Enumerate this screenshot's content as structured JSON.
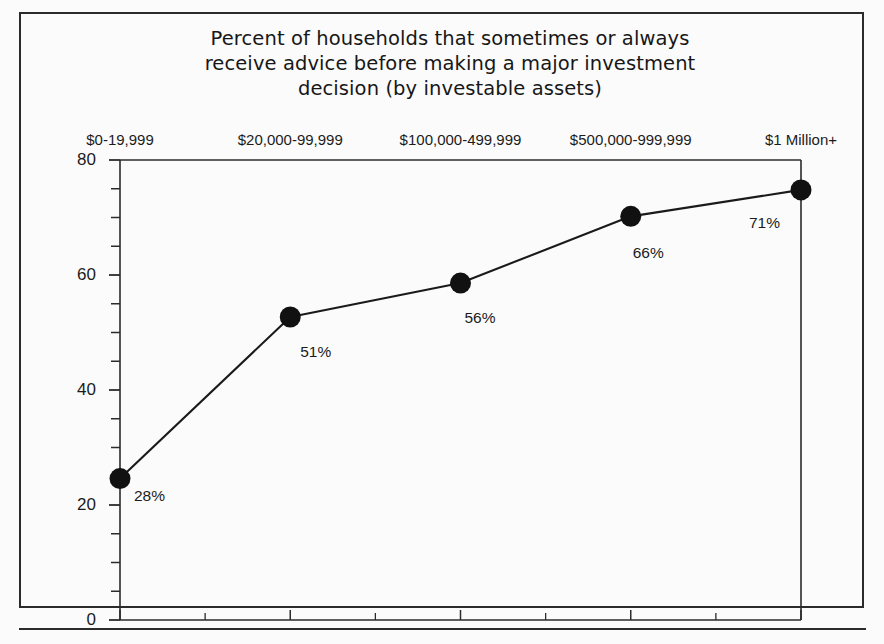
{
  "chart_data": {
    "type": "line",
    "title": "Percent of households that sometimes or always\nreceive advice before making a major investment\ndecision (by investable assets)",
    "title_lines": [
      "Percent of households that sometimes or always",
      "receive advice before making a major investment",
      "decision (by investable assets)"
    ],
    "xlabel": "",
    "ylabel": "",
    "categories": [
      "$0-19,999",
      "$20,000-99,999",
      "$100,000-499,999",
      "$500,000-999,999",
      "$1 Million+"
    ],
    "values": [
      28,
      51,
      56,
      66,
      71
    ],
    "plotted_values": [
      24.6,
      52.7,
      58.6,
      70.2,
      74.8
    ],
    "data_labels": [
      "28%",
      "51%",
      "56%",
      "66%",
      "71%"
    ],
    "ylim": [
      0,
      80
    ],
    "y_ticks": [
      0,
      20,
      40,
      60,
      80
    ],
    "y_tick_labels": [
      "0",
      "20",
      "40",
      "60",
      "80"
    ],
    "y_minor_tick_step": 5,
    "grid": false,
    "legend": null,
    "category_axis_position": "top",
    "marker": "filled-circle",
    "colors": {
      "line": "#1a1a1a",
      "marker": "#111111",
      "axis": "#2b2b2b",
      "text": "#1c1c1c",
      "background": "#fbfbfb"
    }
  },
  "figure": {
    "border_label": "chart-border",
    "footer_rule_label": "footer-rule"
  }
}
